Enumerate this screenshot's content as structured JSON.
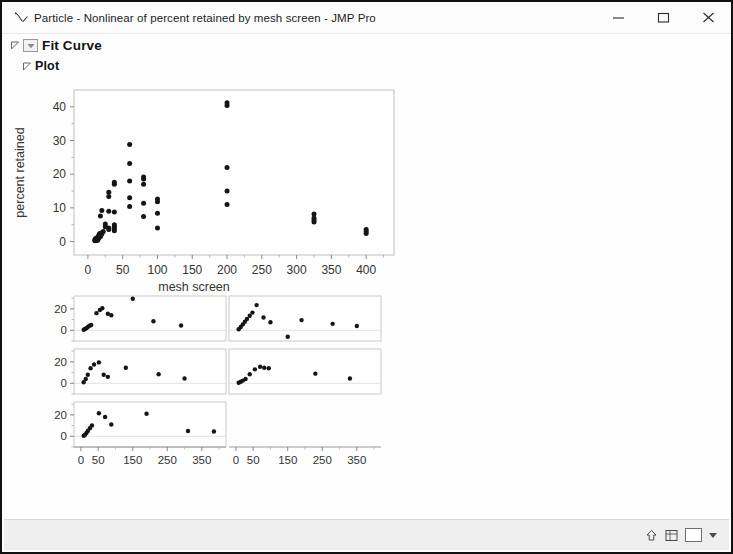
{
  "window": {
    "title": "Particle - Nonlinear of percent retained by mesh screen - JMP Pro",
    "app_icon": "jmp-curve-icon",
    "controls": {
      "minimize": "minimize-icon",
      "maximize": "maximize-icon",
      "close": "close-icon"
    }
  },
  "outline": {
    "fit_curve": "Fit Curve",
    "plot": "Plot"
  },
  "statusbar": {
    "icons": [
      "home-arrow-icon",
      "grid-icon",
      "panel-icon",
      "dropdown-caret-icon"
    ]
  },
  "chart_data": {
    "type": "scatter",
    "title": "",
    "xlabel": "mesh screen",
    "ylabel": "percent retained",
    "xlim": [
      -20,
      440
    ],
    "ylim": [
      -4,
      45
    ],
    "xticks": [
      0,
      50,
      100,
      150,
      200,
      250,
      300,
      350,
      400
    ],
    "yticks": [
      0,
      10,
      20,
      30,
      40
    ],
    "grid": false,
    "points": [
      [
        10,
        0.2
      ],
      [
        10,
        0.5
      ],
      [
        11,
        0.8
      ],
      [
        12,
        0.3
      ],
      [
        12,
        1.0
      ],
      [
        13,
        0.6
      ],
      [
        14,
        1.3
      ],
      [
        14,
        0.4
      ],
      [
        15,
        1.6
      ],
      [
        15,
        0.9
      ],
      [
        16,
        2.0
      ],
      [
        16,
        1.1
      ],
      [
        17,
        2.4
      ],
      [
        18,
        1.5
      ],
      [
        18,
        7.6
      ],
      [
        20,
        9.2
      ],
      [
        20,
        2.2
      ],
      [
        20,
        2.6
      ],
      [
        22,
        3.0
      ],
      [
        25,
        4.4
      ],
      [
        25,
        5.2
      ],
      [
        30,
        13.4
      ],
      [
        30,
        14.6
      ],
      [
        30,
        9.0
      ],
      [
        30,
        3.6
      ],
      [
        30,
        4.0
      ],
      [
        38,
        17.0
      ],
      [
        38,
        17.6
      ],
      [
        38,
        8.8
      ],
      [
        38,
        4.4
      ],
      [
        38,
        5.0
      ],
      [
        38,
        3.2
      ],
      [
        38,
        3.8
      ],
      [
        60,
        28.8
      ],
      [
        60,
        23.2
      ],
      [
        60,
        18.0
      ],
      [
        60,
        13.0
      ],
      [
        60,
        10.4
      ],
      [
        80,
        19.2
      ],
      [
        80,
        18.6
      ],
      [
        80,
        17.0
      ],
      [
        80,
        11.4
      ],
      [
        80,
        7.4
      ],
      [
        100,
        12.6
      ],
      [
        100,
        11.8
      ],
      [
        100,
        8.4
      ],
      [
        100,
        4.0
      ],
      [
        200,
        41.2
      ],
      [
        200,
        40.4
      ],
      [
        200,
        22.0
      ],
      [
        200,
        15.0
      ],
      [
        200,
        11.0
      ],
      [
        325,
        8.2
      ],
      [
        325,
        7.0
      ],
      [
        325,
        6.4
      ],
      [
        325,
        5.8
      ],
      [
        400,
        3.6
      ],
      [
        400,
        3.0
      ],
      [
        400,
        2.4
      ]
    ]
  },
  "residual_panels": {
    "type": "scatter-grid",
    "rows": 3,
    "cols": 2,
    "xticks": [
      0,
      50,
      150,
      250,
      350
    ],
    "yticks": [
      0,
      20
    ],
    "xlim": [
      -20,
      420
    ],
    "ylim": [
      -10,
      32
    ],
    "panels": [
      {
        "row": 0,
        "col": 0,
        "points": [
          [
            8,
            0.5
          ],
          [
            12,
            1.2
          ],
          [
            16,
            2.0
          ],
          [
            20,
            3.0
          ],
          [
            25,
            4.2
          ],
          [
            30,
            5.0
          ],
          [
            45,
            16.0
          ],
          [
            55,
            19.0
          ],
          [
            62,
            20.5
          ],
          [
            78,
            15.5
          ],
          [
            88,
            14.0
          ],
          [
            150,
            29.5
          ],
          [
            210,
            8.5
          ],
          [
            290,
            4.5
          ]
        ]
      },
      {
        "row": 0,
        "col": 1,
        "points": [
          [
            8,
            1.0
          ],
          [
            14,
            3.0
          ],
          [
            20,
            5.5
          ],
          [
            26,
            8.0
          ],
          [
            32,
            10.5
          ],
          [
            40,
            13.5
          ],
          [
            48,
            16.5
          ],
          [
            60,
            23.5
          ],
          [
            80,
            12.0
          ],
          [
            100,
            7.5
          ],
          [
            150,
            -6.0
          ],
          [
            190,
            9.5
          ],
          [
            280,
            6.0
          ],
          [
            350,
            4.0
          ]
        ]
      },
      {
        "row": 1,
        "col": 0,
        "points": [
          [
            8,
            1.0
          ],
          [
            14,
            4.0
          ],
          [
            20,
            8.0
          ],
          [
            28,
            14.0
          ],
          [
            38,
            17.5
          ],
          [
            52,
            19.5
          ],
          [
            66,
            8.0
          ],
          [
            78,
            6.0
          ],
          [
            130,
            14.5
          ],
          [
            225,
            8.5
          ],
          [
            300,
            4.5
          ]
        ]
      },
      {
        "row": 1,
        "col": 1,
        "points": [
          [
            8,
            0.5
          ],
          [
            14,
            1.5
          ],
          [
            20,
            2.5
          ],
          [
            28,
            4.0
          ],
          [
            40,
            8.5
          ],
          [
            55,
            13.0
          ],
          [
            70,
            15.5
          ],
          [
            82,
            14.5
          ],
          [
            95,
            14.0
          ],
          [
            230,
            9.0
          ],
          [
            330,
            4.5
          ]
        ]
      },
      {
        "row": 2,
        "col": 0,
        "points": [
          [
            8,
            0.5
          ],
          [
            12,
            1.5
          ],
          [
            16,
            3.0
          ],
          [
            20,
            5.0
          ],
          [
            26,
            7.5
          ],
          [
            32,
            10.0
          ],
          [
            52,
            21.5
          ],
          [
            70,
            18.0
          ],
          [
            88,
            11.0
          ],
          [
            190,
            21.0
          ],
          [
            310,
            5.0
          ],
          [
            385,
            4.5
          ]
        ]
      }
    ]
  }
}
